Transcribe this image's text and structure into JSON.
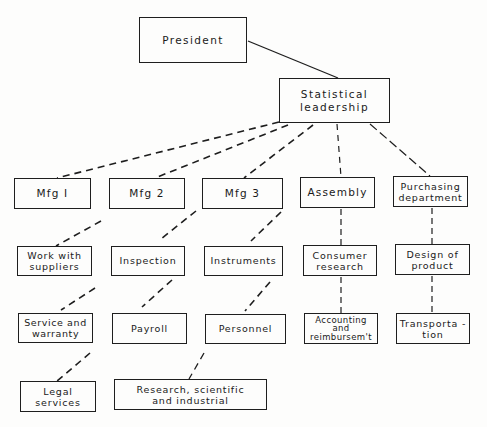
{
  "diagram": {
    "type": "organization-chart",
    "colors": {
      "line": "#1e1e1e",
      "text": "#1a1a1a",
      "background": "#fdfdfc"
    },
    "nodes": {
      "president": "President",
      "statistical_leadership": "Statistical\nleadership",
      "mfg1": "Mfg I",
      "mfg2": "Mfg 2",
      "mfg3": "Mfg 3",
      "assembly": "Assembly",
      "purchasing_department": "Purchasing\ndepartment",
      "work_with_suppliers": "Work with\nsuppliers",
      "inspection": "Inspection",
      "instruments": "Instruments",
      "consumer_research": "Consumer\nresearch",
      "design_of_product": "Design of\nproduct",
      "service_and_warranty": "Service and\nwarranty",
      "payroll": "Payroll",
      "personnel": "Personnel",
      "accounting_and_reimbursement": "Accounting\nand\nreimbursem't",
      "transportation": "Transporta -\ntion",
      "legal_services": "Legal\nservices",
      "research_scientific_industrial": "Research, scientific\nand industrial"
    },
    "edges": [
      {
        "from": "president",
        "to": "statistical_leadership",
        "style": "solid"
      },
      {
        "from": "statistical_leadership",
        "to": "mfg1",
        "style": "dashed"
      },
      {
        "from": "statistical_leadership",
        "to": "mfg2",
        "style": "dashed"
      },
      {
        "from": "statistical_leadership",
        "to": "mfg3",
        "style": "dashed"
      },
      {
        "from": "statistical_leadership",
        "to": "assembly",
        "style": "dashed"
      },
      {
        "from": "statistical_leadership",
        "to": "purchasing_department",
        "style": "dashed"
      },
      {
        "from": "mfg2",
        "to": "work_with_suppliers",
        "style": "dashed"
      },
      {
        "from": "mfg3",
        "to": "inspection",
        "style": "dashed"
      },
      {
        "from": "mfg3",
        "to": "instruments",
        "style": "dashed"
      },
      {
        "from": "assembly",
        "to": "consumer_research",
        "style": "dashed"
      },
      {
        "from": "purchasing_department",
        "to": "design_of_product",
        "style": "dashed"
      },
      {
        "from": "work_with_suppliers",
        "to": "service_and_warranty",
        "style": "dashed"
      },
      {
        "from": "inspection",
        "to": "payroll",
        "style": "dashed"
      },
      {
        "from": "instruments",
        "to": "personnel",
        "style": "dashed"
      },
      {
        "from": "consumer_research",
        "to": "accounting_and_reimbursement",
        "style": "dashed"
      },
      {
        "from": "design_of_product",
        "to": "transportation",
        "style": "dashed"
      },
      {
        "from": "service_and_warranty",
        "to": "legal_services",
        "style": "dashed"
      },
      {
        "from": "personnel",
        "to": "research_scientific_industrial",
        "style": "dashed"
      }
    ]
  }
}
